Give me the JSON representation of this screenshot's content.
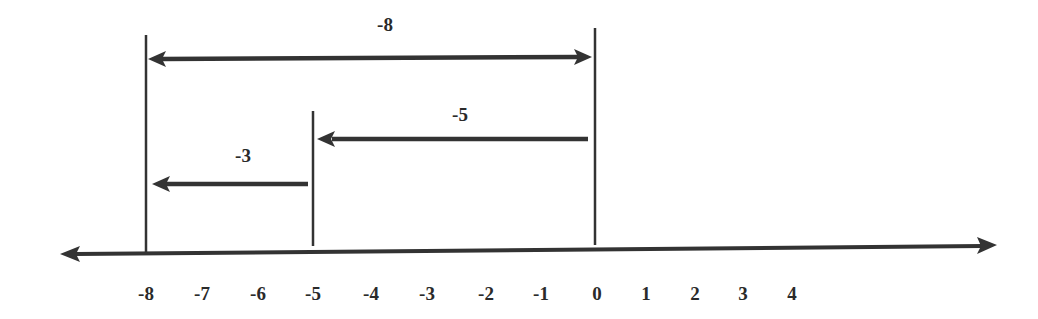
{
  "diagram": {
    "title": "",
    "type": "number-line",
    "colors": {
      "line": "#333333",
      "text": "#2a2a2a",
      "background": "#ffffff"
    },
    "axis": {
      "ticks": [
        {
          "label": "-8",
          "x": 146
        },
        {
          "label": "-7",
          "x": 202
        },
        {
          "label": "-6",
          "x": 258
        },
        {
          "label": "-5",
          "x": 313
        },
        {
          "label": "-4",
          "x": 371
        },
        {
          "label": "-3",
          "x": 427
        },
        {
          "label": "-2",
          "x": 486
        },
        {
          "label": "-1",
          "x": 541
        },
        {
          "label": "0",
          "x": 597
        },
        {
          "label": "1",
          "x": 646
        },
        {
          "label": "2",
          "x": 695
        },
        {
          "label": "3",
          "x": 743
        },
        {
          "label": "4",
          "x": 792
        }
      ]
    },
    "arrows": [
      {
        "label": "-8",
        "from": 0,
        "to": -8,
        "direction": "double"
      },
      {
        "label": "-5",
        "from": 0,
        "to": -5,
        "direction": "left"
      },
      {
        "label": "-3",
        "from": -5,
        "to": -8,
        "direction": "left"
      }
    ],
    "markers": [
      {
        "value": "-8"
      },
      {
        "value": "-5"
      },
      {
        "value": "0"
      }
    ]
  }
}
